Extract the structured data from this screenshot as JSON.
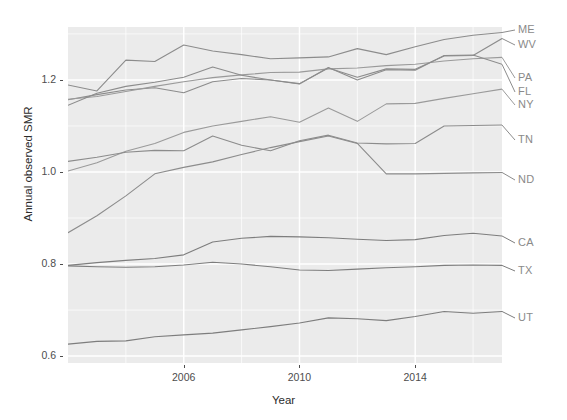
{
  "chart_data": {
    "type": "line",
    "title": "",
    "xlabel": "Year",
    "ylabel": "Annual observed SMR",
    "xlim": [
      2002,
      2017
    ],
    "ylim": [
      0.585,
      1.315
    ],
    "grid": true,
    "legend_position": "right-end-labels",
    "x_ticks": [
      2006,
      2010,
      2014
    ],
    "x_tick_labels": [
      "2006",
      "2010",
      "2014"
    ],
    "y_ticks": [
      0.6,
      0.8,
      1.0,
      1.2
    ],
    "y_tick_labels": [
      "0.6",
      "0.8",
      "1.0",
      "1.2"
    ],
    "x": [
      2002,
      2003,
      2004,
      2005,
      2006,
      2007,
      2008,
      2009,
      2010,
      2011,
      2012,
      2013,
      2014,
      2015,
      2016,
      2017
    ],
    "series": [
      {
        "name": "ME",
        "label": "ME",
        "color": "#8c8c8c",
        "values": [
          1.189,
          1.176,
          1.243,
          1.24,
          1.276,
          1.263,
          1.255,
          1.246,
          1.248,
          1.25,
          1.268,
          1.255,
          1.272,
          1.288,
          1.297,
          1.303
        ]
      },
      {
        "name": "WV",
        "label": "WV",
        "color": "#8c8c8c",
        "values": [
          1.157,
          1.168,
          1.178,
          1.183,
          1.172,
          1.196,
          1.203,
          1.2,
          1.192,
          1.226,
          1.206,
          1.224,
          1.223,
          1.252,
          1.253,
          1.29
        ]
      },
      {
        "name": "PA",
        "label": "PA",
        "color": "#9a9a9a",
        "values": [
          1.158,
          1.164,
          1.175,
          1.186,
          1.196,
          1.205,
          1.211,
          1.216,
          1.217,
          1.224,
          1.226,
          1.231,
          1.234,
          1.241,
          1.246,
          1.249
        ]
      },
      {
        "name": "FL",
        "label": "FL",
        "color": "#8c8c8c",
        "values": [
          1.145,
          1.171,
          1.186,
          1.195,
          1.206,
          1.228,
          1.21,
          1.2,
          1.191,
          1.227,
          1.2,
          1.222,
          1.221,
          1.253,
          1.254,
          1.234
        ]
      },
      {
        "name": "NY",
        "label": "NY",
        "color": "#9a9a9a",
        "values": [
          1.002,
          1.02,
          1.045,
          1.062,
          1.086,
          1.1,
          1.11,
          1.12,
          1.108,
          1.139,
          1.11,
          1.148,
          1.149,
          1.16,
          1.17,
          1.18
        ]
      },
      {
        "name": "TN",
        "label": "TN",
        "color": "#8c8c8c",
        "values": [
          1.023,
          1.032,
          1.043,
          1.047,
          1.046,
          1.078,
          1.058,
          1.046,
          1.068,
          1.08,
          1.063,
          1.061,
          1.062,
          1.1,
          1.101,
          1.102
        ]
      },
      {
        "name": "ND",
        "label": "ND",
        "color": "#8c8c8c",
        "values": [
          0.868,
          0.905,
          0.948,
          0.996,
          1.01,
          1.022,
          1.038,
          1.053,
          1.066,
          1.078,
          1.062,
          0.996,
          0.996,
          0.997,
          0.998,
          0.999
        ]
      },
      {
        "name": "CA",
        "label": "CA",
        "color": "#7d7d7d",
        "values": [
          0.797,
          0.803,
          0.808,
          0.812,
          0.82,
          0.848,
          0.856,
          0.86,
          0.859,
          0.857,
          0.854,
          0.851,
          0.853,
          0.862,
          0.867,
          0.861
        ]
      },
      {
        "name": "TX",
        "label": "TX",
        "color": "#7d7d7d",
        "values": [
          0.796,
          0.794,
          0.793,
          0.794,
          0.798,
          0.804,
          0.8,
          0.794,
          0.787,
          0.786,
          0.789,
          0.792,
          0.794,
          0.797,
          0.798,
          0.797
        ]
      },
      {
        "name": "UT",
        "label": "UT",
        "color": "#7d7d7d",
        "values": [
          0.626,
          0.632,
          0.633,
          0.642,
          0.646,
          0.65,
          0.657,
          0.664,
          0.672,
          0.683,
          0.681,
          0.677,
          0.686,
          0.697,
          0.693,
          0.697
        ]
      }
    ],
    "label_positions": [
      {
        "name": "ME",
        "top": 30
      },
      {
        "name": "WV",
        "top": 45
      },
      {
        "name": "PA",
        "top": 78
      },
      {
        "name": "FL",
        "top": 92
      },
      {
        "name": "NY",
        "top": 105
      },
      {
        "name": "TN",
        "top": 140
      },
      {
        "name": "ND",
        "top": 180
      },
      {
        "name": "CA",
        "top": 243
      },
      {
        "name": "TX",
        "top": 271
      },
      {
        "name": "UT",
        "top": 318
      }
    ],
    "style": {
      "panel_background": "#ebebeb",
      "grid_color": "#ffffff",
      "axis_text_color": "#4d4d4d",
      "axis_title_color": "#2b2b2b",
      "label_color": "#8a8a8a"
    }
  }
}
